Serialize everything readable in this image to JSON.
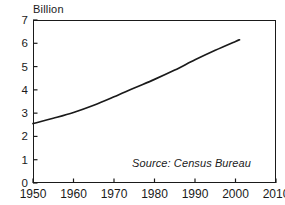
{
  "chart_data": {
    "type": "line",
    "title": "",
    "subtitle": "",
    "xlabel": "",
    "ylabel": "Billion",
    "ylabel_position": "top-left",
    "grid": false,
    "legend": null,
    "xlim": [
      1950,
      2010
    ],
    "ylim": [
      0,
      7
    ],
    "xticks": [
      1950,
      1960,
      1970,
      1980,
      1990,
      2000,
      2010
    ],
    "xtick_labels": [
      "1950",
      "1960",
      "1970",
      "1980",
      "1990",
      "2000",
      "2010"
    ],
    "yticks": [
      0,
      1,
      2,
      3,
      4,
      5,
      6,
      7
    ],
    "ytick_labels": [
      "0",
      "1",
      "2",
      "3",
      "4",
      "5",
      "6",
      "7"
    ],
    "series": [
      {
        "name": "World population",
        "color": "#1a1a1a",
        "x": [
          1950,
          1955,
          1960,
          1965,
          1970,
          1975,
          1980,
          1985,
          1990,
          1995,
          2000,
          2001
        ],
        "values": [
          2.55,
          2.78,
          3.03,
          3.34,
          3.7,
          4.08,
          4.45,
          4.85,
          5.29,
          5.7,
          6.08,
          6.15
        ]
      }
    ],
    "annotations": [
      {
        "text": "Source: Census Bureau",
        "style": "italic",
        "position": "inside-bottom-right"
      }
    ]
  },
  "axis": {
    "y_unit_label": "Billion"
  },
  "source_note": {
    "text": "Source: Census Bureau"
  }
}
